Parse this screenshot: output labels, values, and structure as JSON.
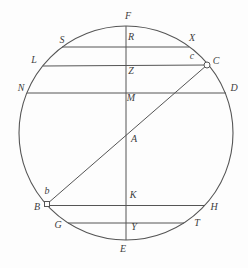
{
  "figure": {
    "background": "#fdfdfd",
    "stroke_color": "#555555",
    "label_color": "#3d3d3d",
    "width": 248,
    "height": 268,
    "circle": {
      "cx": 126,
      "cy": 133,
      "r": 107
    },
    "lines": [
      {
        "name": "vertical-diameter-FE",
        "x1": 126,
        "y1": 26,
        "x2": 126,
        "y2": 240
      },
      {
        "name": "chord-SX",
        "x1": 62,
        "y1": 47,
        "x2": 189,
        "y2": 47
      },
      {
        "name": "chord-LC",
        "x1": 43,
        "y1": 66,
        "x2": 207,
        "y2": 65
      },
      {
        "name": "chord-ND",
        "x1": 27,
        "y1": 93,
        "x2": 226,
        "y2": 93
      },
      {
        "name": "diagonal-BC",
        "x1": 47,
        "y1": 204,
        "x2": 207,
        "y2": 65
      },
      {
        "name": "chord-BH",
        "x1": 47,
        "y1": 205.5,
        "x2": 205,
        "y2": 205.5
      },
      {
        "name": "chord-GT",
        "x1": 68,
        "y1": 223,
        "x2": 184,
        "y2": 223
      }
    ],
    "markers": [
      {
        "name": "point-C-marker",
        "shape": "circle",
        "x": 207,
        "y": 65,
        "size": 3
      },
      {
        "name": "point-B-marker",
        "shape": "square",
        "x": 47,
        "y": 204,
        "size": 5
      }
    ],
    "labels": [
      {
        "text": "F",
        "x": 128,
        "y": 17
      },
      {
        "text": "S",
        "x": 62,
        "y": 41
      },
      {
        "text": "R",
        "x": 131,
        "y": 38
      },
      {
        "text": "X",
        "x": 192,
        "y": 39
      },
      {
        "text": "L",
        "x": 34,
        "y": 61
      },
      {
        "text": "c",
        "x": 192,
        "y": 57
      },
      {
        "text": "C",
        "x": 216,
        "y": 62
      },
      {
        "text": "Z",
        "x": 131,
        "y": 72
      },
      {
        "text": "N",
        "x": 21,
        "y": 89
      },
      {
        "text": "M",
        "x": 131,
        "y": 99
      },
      {
        "text": "D",
        "x": 234,
        "y": 89
      },
      {
        "text": "A",
        "x": 134,
        "y": 140
      },
      {
        "text": "b",
        "x": 47,
        "y": 192
      },
      {
        "text": "B",
        "x": 37,
        "y": 208
      },
      {
        "text": "K",
        "x": 133,
        "y": 196
      },
      {
        "text": "H",
        "x": 214,
        "y": 208
      },
      {
        "text": "G",
        "x": 58,
        "y": 226
      },
      {
        "text": "Y",
        "x": 134,
        "y": 228
      },
      {
        "text": "T",
        "x": 197,
        "y": 224
      },
      {
        "text": "E",
        "x": 123,
        "y": 250
      }
    ]
  }
}
